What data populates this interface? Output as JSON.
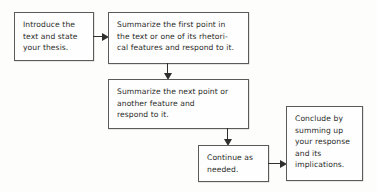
{
  "diagram": {
    "background_color": "#fdfdfc",
    "box_border_color": "#5a5a58",
    "arrow_color": "#2f2f2d",
    "nodes": [
      {
        "id": "introduce",
        "name": "introduce-box",
        "lines": [
          "Introduce the",
          "text and state",
          "your thesis."
        ]
      },
      {
        "id": "summarize_first",
        "name": "summarize-first-point-box",
        "lines": [
          "Summarize the first point in",
          "the text or one of its rhetori-",
          "cal features and respond to it."
        ]
      },
      {
        "id": "summarize_next",
        "name": "summarize-next-point-box",
        "lines": [
          "Summarize the next point or",
          "another feature and",
          "respond to it."
        ]
      },
      {
        "id": "continue",
        "name": "continue-as-needed-box",
        "lines": [
          "Continue as",
          "needed."
        ]
      },
      {
        "id": "conclude",
        "name": "conclude-box",
        "lines": [
          "Conclude by",
          "summing up",
          "your response",
          "and its",
          "implications."
        ]
      }
    ],
    "connectors": [
      {
        "id": "intro_to_first",
        "from": "introduce",
        "to": "summarize_first",
        "direction": "right"
      },
      {
        "id": "first_to_next",
        "from": "summarize_first",
        "to": "summarize_next",
        "direction": "down"
      },
      {
        "id": "next_to_continue",
        "from": "summarize_next",
        "to": "continue",
        "direction": "down"
      },
      {
        "id": "continue_to_conclude",
        "from": "continue",
        "to": "conclude",
        "direction": "right"
      }
    ]
  }
}
